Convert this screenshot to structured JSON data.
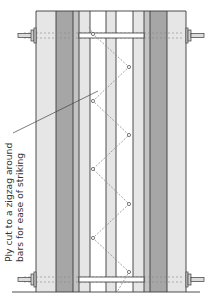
{
  "diagram": {
    "annotation": {
      "line1": "Ply cut to a zigzag around",
      "line2": "bars for ease of striking"
    },
    "colors": {
      "outline": "#3a3a3a",
      "light_strip": "#e6e6e6",
      "mid_strip": "#c4c4c4",
      "dark_strip": "#a6a6a6",
      "white_strip": "#ffffff",
      "cord": "#8a8a8a",
      "leader_line": "#444444"
    },
    "frame": {
      "x_left": 36,
      "x_right": 186,
      "y_top": 11,
      "y_bottom": 292
    },
    "strips": [
      {
        "name": "left-outer-rail",
        "x": 36,
        "w": 20,
        "tone": "light"
      },
      {
        "name": "left-dark-rail",
        "x": 56,
        "w": 17,
        "tone": "dark"
      },
      {
        "name": "left-mid-rail",
        "x": 73,
        "w": 6,
        "tone": "mid"
      },
      {
        "name": "left-inner-rail",
        "x": 79,
        "w": 11,
        "tone": "light"
      },
      {
        "name": "gap-left",
        "x": 90,
        "w": 16,
        "tone": "white"
      },
      {
        "name": "center-rail",
        "x": 106,
        "w": 10,
        "tone": "light"
      },
      {
        "name": "gap-right",
        "x": 116,
        "w": 17,
        "tone": "white"
      },
      {
        "name": "right-inner-rail",
        "x": 133,
        "w": 11,
        "tone": "light"
      },
      {
        "name": "right-mid-rail",
        "x": 144,
        "w": 6,
        "tone": "mid"
      },
      {
        "name": "right-dark-rail",
        "x": 150,
        "w": 17,
        "tone": "dark"
      },
      {
        "name": "right-outer-rail",
        "x": 167,
        "w": 19,
        "tone": "light"
      }
    ],
    "bars": [
      {
        "y": 35
      },
      {
        "y": 279
      }
    ],
    "zigzag_nodes": [
      {
        "x": 93,
        "y": 34
      },
      {
        "x": 129,
        "y": 67
      },
      {
        "x": 93,
        "y": 101
      },
      {
        "x": 129,
        "y": 135
      },
      {
        "x": 93,
        "y": 169
      },
      {
        "x": 129,
        "y": 204
      },
      {
        "x": 93,
        "y": 238
      },
      {
        "x": 129,
        "y": 272
      }
    ]
  }
}
